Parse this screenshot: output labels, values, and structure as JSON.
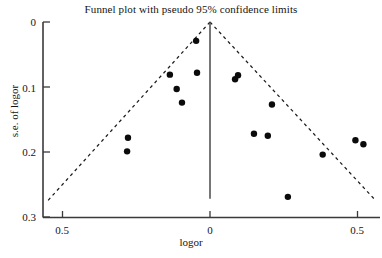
{
  "chart_data": {
    "type": "scatter",
    "title": "Funnel plot with pseudo 95% confidence limits",
    "xlabel": "logor",
    "ylabel": "s.e. of  logor",
    "xlim": [
      -0.58,
      0.585
    ],
    "ylim": [
      0.305,
      -0.012
    ],
    "grid": false,
    "legend": null,
    "xticks": [
      -0.5,
      0,
      0.5
    ],
    "xticklabels": [
      "0.5",
      "0",
      "0.5"
    ],
    "yticks": [
      0,
      0.1,
      0.2,
      0.3
    ],
    "yticklabels": [
      "0",
      "0.1",
      "0.2",
      "0.3"
    ],
    "points": [
      {
        "x": -0.047,
        "y": 0.029
      },
      {
        "x": -0.136,
        "y": 0.081
      },
      {
        "x": -0.044,
        "y": 0.078
      },
      {
        "x": -0.113,
        "y": 0.103
      },
      {
        "x": -0.095,
        "y": 0.124
      },
      {
        "x": -0.278,
        "y": 0.178
      },
      {
        "x": -0.281,
        "y": 0.199
      },
      {
        "x": 0.095,
        "y": 0.082
      },
      {
        "x": 0.085,
        "y": 0.088
      },
      {
        "x": 0.21,
        "y": 0.127
      },
      {
        "x": 0.149,
        "y": 0.172
      },
      {
        "x": 0.196,
        "y": 0.175
      },
      {
        "x": 0.264,
        "y": 0.269
      },
      {
        "x": 0.382,
        "y": 0.204
      },
      {
        "x": 0.493,
        "y": 0.182
      },
      {
        "x": 0.52,
        "y": 0.188
      }
    ],
    "reference_line": {
      "x": 0,
      "y_from": 0.0,
      "y_to": 0.272
    },
    "pseudo_ci_lines": [
      {
        "from": {
          "x": 0.0,
          "y": 0.0
        },
        "to": {
          "x": -0.556,
          "y": 0.278
        }
      },
      {
        "from": {
          "x": 0.0,
          "y": 0.0
        },
        "to": {
          "x": 0.556,
          "y": 0.272
        }
      }
    ]
  }
}
